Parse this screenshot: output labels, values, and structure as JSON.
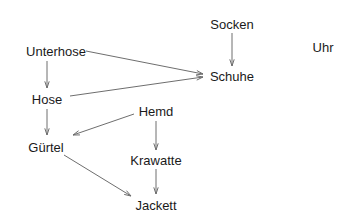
{
  "diagram": {
    "type": "directed-graph",
    "nodes": [
      {
        "id": "socken",
        "label": "Socken",
        "x": 232,
        "y": 24
      },
      {
        "id": "uhr",
        "label": "Uhr",
        "x": 323,
        "y": 47
      },
      {
        "id": "unterhose",
        "label": "Unterhose",
        "x": 56,
        "y": 51
      },
      {
        "id": "schuhe",
        "label": "Schuhe",
        "x": 232,
        "y": 76
      },
      {
        "id": "hose",
        "label": "Hose",
        "x": 47,
        "y": 99
      },
      {
        "id": "hemd",
        "label": "Hemd",
        "x": 156,
        "y": 111
      },
      {
        "id": "guertel",
        "label": "Gürtel",
        "x": 46,
        "y": 147
      },
      {
        "id": "krawatte",
        "label": "Krawatte",
        "x": 156,
        "y": 160
      },
      {
        "id": "jackett",
        "label": "Jackett",
        "x": 156,
        "y": 205
      }
    ],
    "edges": [
      {
        "from": "socken",
        "to": "schuhe",
        "x1": 232,
        "y1": 33,
        "x2": 232,
        "y2": 66
      },
      {
        "from": "unterhose",
        "to": "schuhe",
        "x1": 86,
        "y1": 51,
        "x2": 203,
        "y2": 74
      },
      {
        "from": "unterhose",
        "to": "hose",
        "x1": 47,
        "y1": 61,
        "x2": 47,
        "y2": 88
      },
      {
        "from": "hose",
        "to": "schuhe",
        "x1": 70,
        "y1": 96,
        "x2": 203,
        "y2": 77
      },
      {
        "from": "hose",
        "to": "guertel",
        "x1": 47,
        "y1": 109,
        "x2": 47,
        "y2": 135
      },
      {
        "from": "hemd",
        "to": "guertel",
        "x1": 134,
        "y1": 114,
        "x2": 73,
        "y2": 135
      },
      {
        "from": "hemd",
        "to": "krawatte",
        "x1": 156,
        "y1": 121,
        "x2": 156,
        "y2": 150
      },
      {
        "from": "guertel",
        "to": "jackett",
        "x1": 64,
        "y1": 155,
        "x2": 131,
        "y2": 196
      },
      {
        "from": "krawatte",
        "to": "jackett",
        "x1": 156,
        "y1": 169,
        "x2": 156,
        "y2": 194
      }
    ],
    "colors": {
      "edge": "#6e6e6e",
      "text": "#1a1a1a",
      "background": "#ffffff"
    }
  }
}
